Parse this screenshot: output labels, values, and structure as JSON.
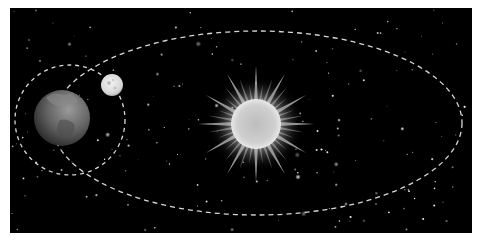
{
  "diagram": {
    "bodies": [
      {
        "name": "Sun",
        "role": "center"
      },
      {
        "name": "Earth",
        "role": "orbits Sun"
      },
      {
        "name": "Moon",
        "role": "orbits Earth"
      }
    ],
    "orbits": [
      {
        "name": "Earth orbit",
        "around": "Sun",
        "style": "dashed"
      },
      {
        "name": "Moon orbit",
        "around": "Earth",
        "style": "dashed"
      }
    ],
    "colors": {
      "background": "#000000",
      "border": "#ffffff",
      "orbit_line": "#d8d8d8",
      "sun_core": "#c8c8c8",
      "earth": "#6e6e6e",
      "moon": "#e6e6e6",
      "stars": "#ffffff"
    }
  }
}
